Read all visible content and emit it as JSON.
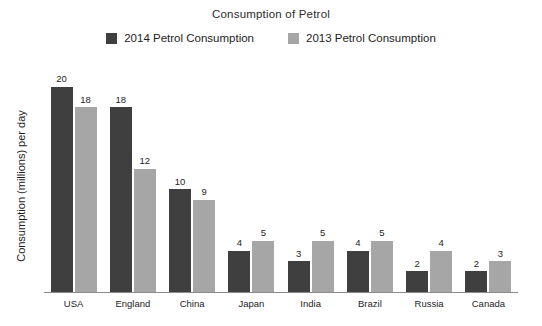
{
  "chart_data": {
    "type": "bar",
    "title": "Consumption of Petrol",
    "xlabel": "",
    "ylabel": "Consumption (millions) per day",
    "ylim": [
      0,
      22
    ],
    "grid": false,
    "legend_position": "top-center",
    "categories": [
      "USA",
      "England",
      "China",
      "Japan",
      "India",
      "Brazil",
      "Russia",
      "Canada"
    ],
    "series": [
      {
        "name": "2014 Petrol Consumption",
        "color": "#3f3f3f",
        "values": [
          20,
          18,
          10,
          4,
          3,
          4,
          2,
          2
        ]
      },
      {
        "name": "2013 Petrol Consumption",
        "color": "#a6a6a6",
        "values": [
          18,
          12,
          9,
          5,
          5,
          5,
          4,
          3
        ]
      }
    ]
  }
}
